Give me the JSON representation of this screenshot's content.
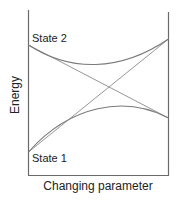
{
  "diagram": {
    "title": "",
    "y_axis_label": "Energy",
    "x_axis_label": "Changing parameter",
    "states": [
      {
        "label": "State 2"
      },
      {
        "label": "State 1"
      }
    ],
    "curves": [
      {
        "name": "diabatic-state-2",
        "description": "straight line descending from State 2 (upper left) to lower right"
      },
      {
        "name": "diabatic-state-1",
        "description": "straight line ascending from State 1 (lower left) to upper right"
      },
      {
        "name": "adiabatic-upper",
        "description": "upper avoided-crossing curve, concave up"
      },
      {
        "name": "adiabatic-lower",
        "description": "lower avoided-crossing curve, concave down"
      }
    ],
    "colors": {
      "axis": "#6a6a6a",
      "lines": "#8a8a8a",
      "text": "#222222"
    }
  }
}
